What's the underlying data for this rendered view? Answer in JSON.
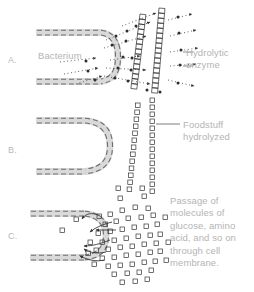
{
  "figure": {
    "background_color": "#ffffff",
    "width": 254,
    "height": 292
  },
  "colors": {
    "membrane_band": "#d7d7d7",
    "membrane_dash": "#7b7b7b",
    "molecule_outline": "#4a4a4a",
    "arrow": "#3a3a3a",
    "label_text": "#b4b4b4",
    "panel_letter": "#b9b9b9",
    "leader_line": "#6e6e6e"
  },
  "panels": [
    {
      "id": "A",
      "letter": "A.",
      "letter_position": {
        "x": 8,
        "y": 55
      },
      "description": "Bacterium secretes hydrolytic enzymes outward toward foodstuff chains"
    },
    {
      "id": "B",
      "letter": "B.",
      "letter_position": {
        "x": 8,
        "y": 145
      },
      "description": "Foodstuff hydrolyzed into square subunits outside the cell"
    },
    {
      "id": "C",
      "letter": "C.",
      "letter_position": {
        "x": 8,
        "y": 231
      },
      "description": "Passage of small molecules back through the cell membrane"
    }
  ],
  "labels": {
    "bacterium": "Bacterium",
    "hydrolytic_enzyme": "Hydrolytic\nenzyme",
    "hydrolytic_enzyme_line1": "Hydrolytic",
    "hydrolytic_enzyme_line2": "enzyme",
    "foodstuff_hydrolyzed_line1": "Foodstuff",
    "foodstuff_hydrolyzed_line2": "hydrolyzed",
    "passage_caption": "Passage of molecules of glucose, amino acid, and so on through cell membrane."
  },
  "icons": {
    "membrane": "membrane-band-icon",
    "enzyme_particle": "enzyme-dot-icon",
    "foodstuff_chain": "foodstuff-chain-icon",
    "molecule": "molecule-square-icon",
    "arrow": "arrow-icon",
    "leader": "leader-line-icon"
  }
}
